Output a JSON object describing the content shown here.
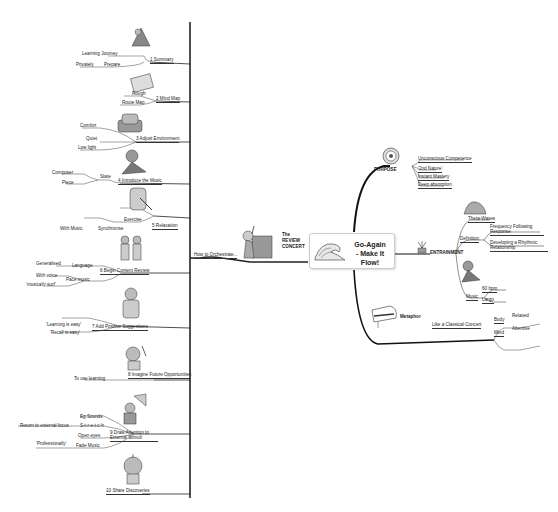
{
  "central": {
    "title_line1": "Go-Again",
    "title_line2": "- Make It Flow!"
  },
  "left_branch": {
    "label": "How to Orchestrate...",
    "image_caption": [
      "The",
      "REVIEW",
      "CONCERT"
    ],
    "steps": [
      {
        "label": "1 Summary",
        "children": [
          {
            "label": "Learning Journey"
          },
          {
            "label": "Prepare",
            "children": [
              {
                "label": "Privately"
              }
            ]
          }
        ]
      },
      {
        "label": "2 Mind Map",
        "children": [
          {
            "label": "Rough"
          },
          {
            "label": "Route Map"
          }
        ]
      },
      {
        "label": "3 Adjust Environment",
        "children": [
          {
            "label": "Comfort"
          },
          {
            "label": "Quiet"
          },
          {
            "label": "Low light"
          }
        ]
      },
      {
        "label": "4 Introduce the Music",
        "children": [
          {
            "label": "State",
            "children": [
              {
                "label": "Composer"
              },
              {
                "label": "Piece"
              }
            ]
          }
        ]
      },
      {
        "label": "5 Relaxation",
        "children": [
          {
            "label": "Exercise"
          },
          {
            "label": "Synchronise",
            "children": [
              {
                "label": "With Music"
              }
            ]
          }
        ]
      },
      {
        "label": "6 Begin Content Review",
        "children": [
          {
            "label": "Language",
            "children": [
              {
                "label": "Generalised"
              }
            ]
          },
          {
            "label": "Pace music",
            "children": [
              {
                "label": "With voice"
              },
              {
                "label": "'musically surf'"
              }
            ]
          }
        ]
      },
      {
        "label": "7 Add Positive Suggestions",
        "children": [
          {
            "label": "'Learning is easy'"
          },
          {
            "label": "'Recall is easy'"
          }
        ]
      },
      {
        "label": "8 Imagine Future Opportunities",
        "children": [
          {
            "label": "To use learning"
          }
        ]
      },
      {
        "label": "9 Draw Attention to External Stimuli",
        "children": [
          {
            "label": "Eg Sounds"
          },
          {
            "label": "S-t-r-e-t-c-h",
            "children": [
              {
                "label": "Return to external focus"
              }
            ]
          },
          {
            "label": "Open eyes"
          },
          {
            "label": "Fade Music",
            "children": [
              {
                "label": "'Professionally'"
              }
            ]
          }
        ]
      },
      {
        "label": "10 Share Discoveries"
      }
    ]
  },
  "right_branches": {
    "purpose": {
      "label": "PURPOSE",
      "children": [
        "Unconscious Competence",
        "'2nd Nature'",
        "Instant Mastery",
        "Deep absorption"
      ]
    },
    "entrainment": {
      "label": "ENTRAINMENT",
      "theta": "Theta-Waves",
      "definition": {
        "label": "Definition",
        "children": [
          "Frequency Following Response",
          "Developing a Rhythmic Relationship"
        ]
      },
      "music": {
        "label": "Music",
        "children": [
          "60 bpm",
          "Largo"
        ]
      }
    },
    "metaphor": {
      "label": "Metaphor",
      "concert": "Like a Classical Concert",
      "body": {
        "label": "Body",
        "value": "Relaxed"
      },
      "mind": {
        "label": "Mind",
        "value": "Attentive"
      }
    }
  },
  "colors": {
    "line": "#222222",
    "text": "#222222",
    "background": "#ffffff"
  }
}
